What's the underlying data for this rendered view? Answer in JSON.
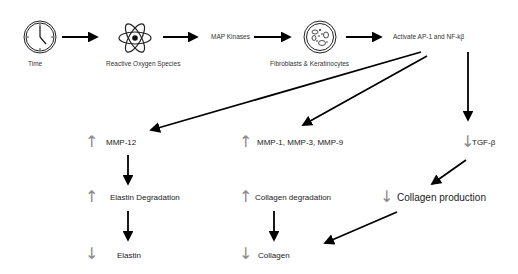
{
  "diagram": {
    "type": "flowchart",
    "top_row": {
      "nodes": [
        {
          "id": "time",
          "label": "Time",
          "icon": "clock-icon"
        },
        {
          "id": "ros",
          "label": "Reactive Oxygen Species",
          "icon": "atom-icon"
        },
        {
          "id": "mapk",
          "label": "MAP Kinases"
        },
        {
          "id": "cells",
          "label": "Fibroblasts & Keratinocytes",
          "icon": "petri-dish-icon"
        },
        {
          "id": "ap1",
          "label": "Activate AP-1 and NF-kβ"
        }
      ]
    },
    "branches": [
      {
        "id": "elastin-branch",
        "nodes": [
          {
            "indicator": "↑",
            "label": "MMP-12"
          },
          {
            "indicator": "↑",
            "label": "Elastin Degradation"
          },
          {
            "indicator": "↓",
            "label": "Elastin"
          }
        ]
      },
      {
        "id": "collagen-degradation-branch",
        "nodes": [
          {
            "indicator": "↑",
            "label": "MMP-1, MMP-3, MMP-9"
          },
          {
            "indicator": "↑",
            "label": "Collagen degradation"
          },
          {
            "indicator": "↓",
            "label": "Collagen"
          }
        ]
      },
      {
        "id": "tgf-branch",
        "nodes": [
          {
            "indicator": "↓",
            "label": "TGF-β"
          },
          {
            "indicator": "↓",
            "label": "Collagen production"
          }
        ]
      }
    ],
    "edges": [
      [
        "Time",
        "Reactive Oxygen Species"
      ],
      [
        "Reactive Oxygen Species",
        "MAP Kinases"
      ],
      [
        "MAP Kinases",
        "Fibroblasts & Keratinocytes"
      ],
      [
        "Fibroblasts & Keratinocytes",
        "Activate AP-1 and NF-kβ"
      ],
      [
        "Activate AP-1 and NF-kβ",
        "MMP-12"
      ],
      [
        "Activate AP-1 and NF-kβ",
        "MMP-1, MMP-3, MMP-9"
      ],
      [
        "Activate AP-1 and NF-kβ",
        "TGF-β"
      ],
      [
        "MMP-12",
        "Elastin Degradation"
      ],
      [
        "Elastin Degradation",
        "Elastin"
      ],
      [
        "Collagen degradation",
        "Collagen"
      ],
      [
        "TGF-β",
        "Collagen production"
      ],
      [
        "Collagen production",
        "Collagen"
      ]
    ],
    "colors": {
      "arrow": "#000000",
      "indicator": "#8a8a8a",
      "text": "#222222"
    }
  }
}
